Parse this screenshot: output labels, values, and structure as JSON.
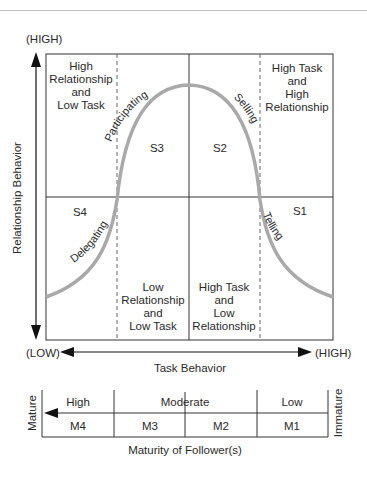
{
  "diagram": {
    "y_axis": {
      "label": "Relationship Behavior",
      "high": "(HIGH)",
      "low": "(LOW)"
    },
    "x_axis": {
      "label": "Task Behavior",
      "low": "(LOW)",
      "high": "(HIGH)"
    },
    "quadrants": {
      "top_left": [
        "High",
        "Relationship",
        "and",
        "Low Task"
      ],
      "top_right": [
        "High Task",
        "and",
        "High",
        "Relationship"
      ],
      "bottom_mid_left": [
        "Low",
        "Relationship",
        "and",
        "Low Task"
      ],
      "bottom_mid_right": [
        "High Task",
        "and",
        "Low",
        "Relationship"
      ]
    },
    "styles": {
      "s1": "S1",
      "s2": "S2",
      "s3": "S3",
      "s4": "S4"
    },
    "curve_labels": {
      "participating": "Participating",
      "selling": "Selling",
      "delegating": "Delegating",
      "telling": "Telling"
    },
    "maturity": {
      "label": "Maturity of Follower(s)",
      "left_end": "Mature",
      "right_end": "Immature",
      "levels": [
        "High",
        "Moderate",
        "Low"
      ],
      "stages": [
        "M4",
        "M3",
        "M2",
        "M1"
      ]
    },
    "colors": {
      "curve": "#a9a9a9",
      "lines": "#333333",
      "dashed": "#666666"
    }
  }
}
